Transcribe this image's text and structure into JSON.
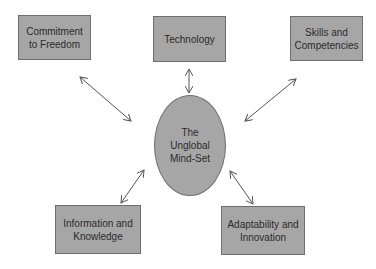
{
  "diagram": {
    "center": {
      "label": "The\nUnglobal\nMind-Set"
    },
    "nodes": [
      {
        "id": "commitment",
        "label": "Commitment\nto Freedom"
      },
      {
        "id": "technology",
        "label": "Technology"
      },
      {
        "id": "skills",
        "label": "Skills and\nCompetencies"
      },
      {
        "id": "information",
        "label": "Information and\nKnowledge"
      },
      {
        "id": "adaptability",
        "label": "Adaptability and\nInnovation"
      }
    ],
    "edges": [
      {
        "from": "center",
        "to": "commitment",
        "type": "bidirectional"
      },
      {
        "from": "center",
        "to": "technology",
        "type": "bidirectional"
      },
      {
        "from": "center",
        "to": "skills",
        "type": "bidirectional"
      },
      {
        "from": "center",
        "to": "information",
        "type": "bidirectional"
      },
      {
        "from": "center",
        "to": "adaptability",
        "type": "bidirectional"
      }
    ],
    "colors": {
      "fill": "#a6a6a6",
      "border": "#6e6e6e",
      "arrow": "#555555"
    }
  }
}
